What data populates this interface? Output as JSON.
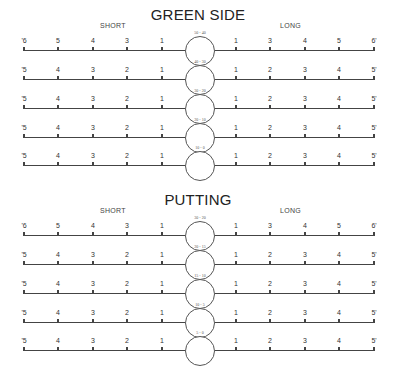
{
  "sections": [
    {
      "title": "GREEN SIDE",
      "short_label": "SHORT",
      "long_label": "LONG",
      "rows": [
        {
          "range": "50 - 40",
          "left": [
            "'6",
            "5",
            "4",
            "3",
            "1"
          ],
          "right": [
            "1",
            "3",
            "4",
            "5",
            "6'"
          ]
        },
        {
          "range": "40 - 30",
          "left": [
            "'5",
            "4",
            "3",
            "2",
            "1"
          ],
          "right": [
            "1",
            "2",
            "3",
            "4",
            "5'"
          ]
        },
        {
          "range": "30 - 20",
          "left": [
            "'5",
            "4",
            "3",
            "2",
            "1"
          ],
          "right": [
            "1",
            "2",
            "3",
            "4",
            "5'"
          ]
        },
        {
          "range": "20 - 10",
          "left": [
            "'5",
            "4",
            "3",
            "2",
            "1"
          ],
          "right": [
            "1",
            "2",
            "3",
            "4",
            "5'"
          ]
        },
        {
          "range": "10 - 0",
          "left": [
            "'5",
            "4",
            "3",
            "2",
            "1"
          ],
          "right": [
            "1",
            "2",
            "3",
            "4",
            "5'"
          ]
        }
      ]
    },
    {
      "title": "PUTTING",
      "short_label": "SHORT",
      "long_label": "LONG",
      "rows": [
        {
          "range": "30 - 20",
          "left": [
            "'6",
            "5",
            "4",
            "3",
            "1"
          ],
          "right": [
            "1",
            "3",
            "4",
            "5",
            "6'"
          ]
        },
        {
          "range": "20 - 15",
          "left": [
            "'5",
            "4",
            "3",
            "2",
            "1"
          ],
          "right": [
            "1",
            "2",
            "3",
            "4",
            "5'"
          ]
        },
        {
          "range": "15 - 10",
          "left": [
            "'5",
            "4",
            "3",
            "2",
            "1"
          ],
          "right": [
            "1",
            "2",
            "3",
            "4",
            "5'"
          ]
        },
        {
          "range": "10 - 5",
          "left": [
            "'5",
            "4",
            "3",
            "2",
            "1"
          ],
          "right": [
            "1",
            "2",
            "3",
            "4",
            "5'"
          ]
        },
        {
          "range": "5 - 0",
          "left": [
            "'5",
            "4",
            "3",
            "2",
            "1"
          ],
          "right": [
            "1",
            "2",
            "3",
            "4",
            "5'"
          ]
        }
      ]
    }
  ]
}
